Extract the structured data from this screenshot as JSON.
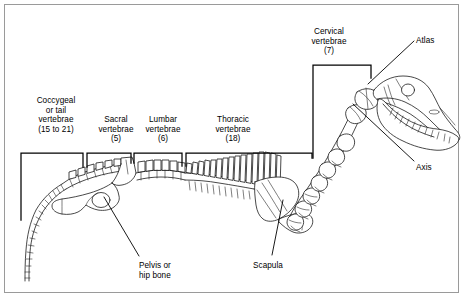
{
  "figure": {
    "kind": "anatomical-diagram",
    "background_color": "#ffffff",
    "frame_color": "#9a9a9a",
    "ink_color": "#1a1a1a"
  },
  "bracket_labels": [
    {
      "id": "coccygeal",
      "name": "Coccygeal",
      "lines": [
        "Coccygeal",
        "or tail",
        "vertebrae",
        "(15 to 21)"
      ],
      "text": "Coccygeal\nor tail\nvertebrae\n(15 to 21)",
      "count_text": "(15 to 21)",
      "count_min": 15,
      "count_max": 21,
      "label_x": 24,
      "label_y": 96,
      "label_width": 64,
      "align": "center"
    },
    {
      "id": "sacral",
      "name": "Sacral",
      "lines": [
        "Sacral",
        "vertebrae",
        "(5)"
      ],
      "text": "Sacral\nvertebrae\n(5)",
      "count_text": "(5)",
      "count_min": 5,
      "count_max": 5,
      "label_x": 92,
      "label_y": 115,
      "label_width": 48,
      "align": "center"
    },
    {
      "id": "lumbar",
      "name": "Lumbar",
      "lines": [
        "Lumbar",
        "vertebrae",
        "(6)"
      ],
      "text": "Lumbar\nvertebrae\n(6)",
      "count_text": "(6)",
      "count_min": 6,
      "count_max": 6,
      "label_x": 139,
      "label_y": 115,
      "label_width": 48,
      "align": "center"
    },
    {
      "id": "thoracic",
      "name": "Thoracic",
      "lines": [
        "Thoracic",
        "vertebrae",
        "(18)"
      ],
      "text": "Thoracic\nvertebrae\n(18)",
      "count_text": "(18)",
      "count_min": 18,
      "count_max": 18,
      "label_x": 203,
      "label_y": 115,
      "label_width": 60,
      "align": "center"
    },
    {
      "id": "cervical",
      "name": "Cervical",
      "lines": [
        "Cervical",
        "vertebrae",
        "(7)"
      ],
      "text": "Cervical\nvertebrae\n(7)",
      "count_text": "(7)",
      "count_min": 7,
      "count_max": 7,
      "label_x": 299,
      "label_y": 27,
      "label_width": 60,
      "align": "center"
    }
  ],
  "leader_labels": [
    {
      "id": "atlas",
      "name": "Atlas",
      "text": "Atlas",
      "label_x": 416,
      "label_y": 36,
      "label_width": 40,
      "align": "left"
    },
    {
      "id": "axis",
      "name": "Axis",
      "text": "Axis",
      "label_x": 416,
      "label_y": 163,
      "label_width": 40,
      "align": "left"
    },
    {
      "id": "pelvis",
      "name": "Pelvis or hip bone",
      "lines": [
        "Pelvis or",
        "hip bone"
      ],
      "text": "Pelvis or\nhip bone",
      "label_x": 139,
      "label_y": 261,
      "label_width": 56,
      "align": "left"
    },
    {
      "id": "scapula",
      "name": "Scapula",
      "text": "Scapula",
      "label_x": 253,
      "label_y": 261,
      "label_width": 50,
      "align": "left"
    }
  ],
  "anatomy_parts": [
    "tail-vertebrae-chain",
    "sacral-vertebrae",
    "lumbar-vertebrae",
    "thoracic-vertebrae",
    "cervical-vertebrae",
    "atlas-vertebra",
    "axis-vertebra",
    "pelvis-bone",
    "scapula-bone",
    "humerus-bone",
    "skull",
    "mandible",
    "teeth-row",
    "eye-socket"
  ]
}
